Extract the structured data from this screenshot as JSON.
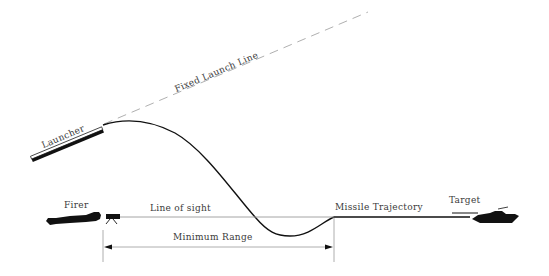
{
  "diagram": {
    "labels": {
      "launcher": "Launcher",
      "fixed_launch_line": "Fixed Launch Line",
      "firer": "Firer",
      "line_of_sight": "Line of sight",
      "missile_trajectory": "Missile Trajectory",
      "target": "Target",
      "minimum_range": "Minimum Range"
    },
    "colors": {
      "ink": "#111111",
      "light_line": "#9a9a9a",
      "text": "#3a3a3a",
      "background": "#ffffff"
    }
  }
}
